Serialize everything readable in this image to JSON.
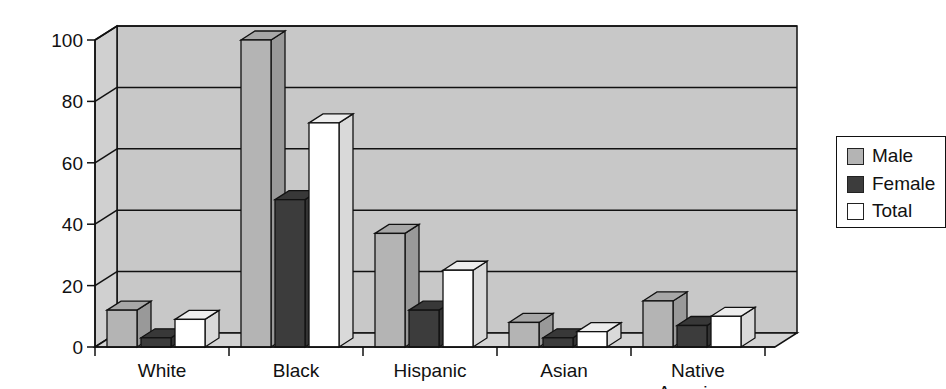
{
  "chart_data": {
    "type": "bar",
    "style": "3d-clustered-column",
    "title": "",
    "xlabel": "",
    "ylabel": "",
    "ylim": [
      0,
      100
    ],
    "yticks": [
      0,
      20,
      40,
      60,
      80,
      100
    ],
    "grid": true,
    "legend_position": "right",
    "categories": [
      "White",
      "Black",
      "Hispanic",
      "Asian",
      "Native American"
    ],
    "category_label_lines": [
      [
        "White"
      ],
      [
        "Black"
      ],
      [
        "Hispanic"
      ],
      [
        "Asian"
      ],
      [
        "Native",
        "American"
      ]
    ],
    "series": [
      {
        "name": "Male",
        "color": "#b4b4b4",
        "values": [
          12,
          100,
          37,
          8,
          15
        ]
      },
      {
        "name": "Female",
        "color": "#3c3c3c",
        "values": [
          3,
          48,
          12,
          3,
          7
        ]
      },
      {
        "name": "Total",
        "color": "#ffffff",
        "values": [
          9,
          73,
          25,
          5,
          10
        ]
      }
    ]
  },
  "legend": {
    "items": [
      {
        "label": "Male",
        "color": "#b4b4b4"
      },
      {
        "label": "Female",
        "color": "#3c3c3c"
      },
      {
        "label": "Total",
        "color": "#ffffff"
      }
    ]
  },
  "colors": {
    "plot_background": "#c8c8c8",
    "floor": "#d4d4d4",
    "axis": "#111111"
  }
}
